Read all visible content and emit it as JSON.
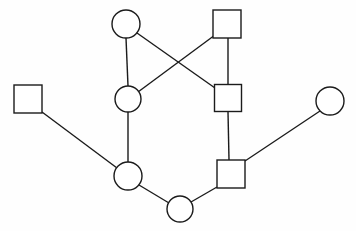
{
  "diagram": {
    "type": "node-link-graph",
    "title": "",
    "canvas": {
      "width": 356,
      "height": 231,
      "background": "#fefefe"
    },
    "style": {
      "stroke_color": "#1b1b1b",
      "stroke_width": 1.4,
      "node_fill": "#ffffff"
    },
    "node_shapes": [
      "circle",
      "square"
    ],
    "node_count": 9,
    "edge_count": 10,
    "nodes": [
      {
        "id": "c1",
        "shape": "circle",
        "label": "",
        "cx": 126,
        "cy": 24,
        "r": 14
      },
      {
        "id": "s1",
        "shape": "square",
        "label": "",
        "cx": 227,
        "cy": 24,
        "size": 28
      },
      {
        "id": "c2",
        "shape": "circle",
        "label": "",
        "cx": 128,
        "cy": 99,
        "r": 13
      },
      {
        "id": "s2",
        "shape": "square",
        "label": "",
        "cx": 228,
        "cy": 98,
        "size": 27
      },
      {
        "id": "s3",
        "shape": "square",
        "label": "",
        "cx": 28,
        "cy": 99,
        "size": 28
      },
      {
        "id": "c3",
        "shape": "circle",
        "label": "",
        "cx": 330,
        "cy": 101,
        "r": 14
      },
      {
        "id": "c4",
        "shape": "circle",
        "label": "",
        "cx": 128,
        "cy": 176,
        "r": 14
      },
      {
        "id": "s4",
        "shape": "square",
        "label": "",
        "cx": 231,
        "cy": 174,
        "size": 28
      },
      {
        "id": "c5",
        "shape": "circle",
        "label": "",
        "cx": 180,
        "cy": 209,
        "r": 13
      }
    ],
    "edges": [
      {
        "id": "e1",
        "from": "c1",
        "to": "c2",
        "x1": 126,
        "y1": 38,
        "x2": 128,
        "y2": 86
      },
      {
        "id": "e2",
        "from": "c1",
        "to": "s2",
        "x1": 137,
        "y1": 33,
        "x2": 215,
        "y2": 88
      },
      {
        "id": "e3",
        "from": "s1",
        "to": "c2",
        "x1": 215,
        "y1": 35,
        "x2": 138,
        "y2": 92
      },
      {
        "id": "e4",
        "from": "s1",
        "to": "s2",
        "x1": 228,
        "y1": 38,
        "x2": 228,
        "y2": 85
      },
      {
        "id": "e5",
        "from": "c2",
        "to": "c4",
        "x1": 128,
        "y1": 112,
        "x2": 128,
        "y2": 162
      },
      {
        "id": "e6",
        "from": "s2",
        "to": "s4",
        "x1": 228,
        "y1": 112,
        "x2": 229,
        "y2": 160
      },
      {
        "id": "e7",
        "from": "s3",
        "to": "c4",
        "x1": 42,
        "y1": 112,
        "x2": 117,
        "y2": 168
      },
      {
        "id": "e8",
        "from": "c4",
        "to": "c5",
        "x1": 139,
        "y1": 185,
        "x2": 169,
        "y2": 203
      },
      {
        "id": "e9",
        "from": "c5",
        "to": "s4",
        "x1": 191,
        "y1": 202,
        "x2": 217,
        "y2": 187
      },
      {
        "id": "e10",
        "from": "c3",
        "to": "s4",
        "x1": 320,
        "y1": 111,
        "x2": 245,
        "y2": 161
      }
    ]
  }
}
